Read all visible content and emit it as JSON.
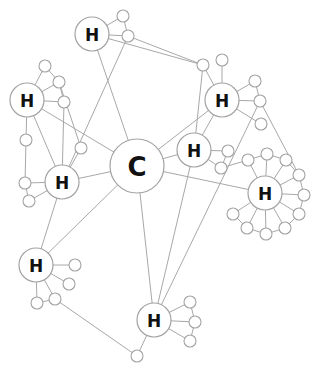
{
  "diagram": {
    "title": "",
    "colors": {
      "edge": "#a8a8a8",
      "node_stroke": "#a3a3a3",
      "node_fill": "#ffffff",
      "label": "#111111"
    },
    "hubs": [
      {
        "id": "C",
        "label": "C",
        "x": 137,
        "y": 166,
        "r": 27,
        "size": 26
      },
      {
        "id": "H1",
        "label": "H",
        "x": 92,
        "y": 34,
        "r": 17,
        "size": 17
      },
      {
        "id": "H2",
        "label": "H",
        "x": 27,
        "y": 100,
        "r": 17,
        "size": 17
      },
      {
        "id": "H3",
        "label": "H",
        "x": 62,
        "y": 182,
        "r": 17,
        "size": 17
      },
      {
        "id": "H4",
        "label": "H",
        "x": 222,
        "y": 100,
        "r": 17,
        "size": 17
      },
      {
        "id": "H5",
        "label": "H",
        "x": 194,
        "y": 150,
        "r": 17,
        "size": 17
      },
      {
        "id": "H6",
        "label": "H",
        "x": 265,
        "y": 193,
        "r": 17,
        "size": 17
      },
      {
        "id": "H7",
        "label": "H",
        "x": 36,
        "y": 265,
        "r": 17,
        "size": 17
      },
      {
        "id": "H8",
        "label": "H",
        "x": 154,
        "y": 320,
        "r": 17,
        "size": 17
      }
    ],
    "leaves": [
      {
        "id": "a1",
        "x": 123,
        "y": 16
      },
      {
        "id": "a2",
        "x": 128,
        "y": 36
      },
      {
        "id": "b1",
        "x": 45,
        "y": 66
      },
      {
        "id": "b2",
        "x": 59,
        "y": 82
      },
      {
        "id": "b3",
        "x": 64,
        "y": 102
      },
      {
        "id": "b4",
        "x": 26,
        "y": 140
      },
      {
        "id": "c1",
        "x": 81,
        "y": 148
      },
      {
        "id": "c2",
        "x": 25,
        "y": 183
      },
      {
        "id": "c3",
        "x": 29,
        "y": 201
      },
      {
        "id": "d1",
        "x": 203,
        "y": 65
      },
      {
        "id": "d2",
        "x": 222,
        "y": 60
      },
      {
        "id": "d3",
        "x": 255,
        "y": 81
      },
      {
        "id": "d4",
        "x": 260,
        "y": 101
      },
      {
        "id": "d5",
        "x": 261,
        "y": 124
      },
      {
        "id": "e1",
        "x": 228,
        "y": 151
      },
      {
        "id": "e2",
        "x": 221,
        "y": 168
      },
      {
        "id": "f1",
        "x": 248,
        "y": 160
      },
      {
        "id": "f2",
        "x": 267,
        "y": 154
      },
      {
        "id": "f3",
        "x": 286,
        "y": 160
      },
      {
        "id": "f4",
        "x": 299,
        "y": 175
      },
      {
        "id": "f5",
        "x": 304,
        "y": 195
      },
      {
        "id": "f6",
        "x": 299,
        "y": 214
      },
      {
        "id": "f7",
        "x": 285,
        "y": 228
      },
      {
        "id": "f8",
        "x": 266,
        "y": 234
      },
      {
        "id": "f9",
        "x": 247,
        "y": 228
      },
      {
        "id": "f10",
        "x": 233,
        "y": 214
      },
      {
        "id": "g1",
        "x": 75,
        "y": 265
      },
      {
        "id": "g2",
        "x": 69,
        "y": 284
      },
      {
        "id": "g3",
        "x": 37,
        "y": 303
      },
      {
        "id": "g4",
        "x": 55,
        "y": 299
      },
      {
        "id": "h1",
        "x": 190,
        "y": 302
      },
      {
        "id": "h2",
        "x": 195,
        "y": 322
      },
      {
        "id": "h3",
        "x": 190,
        "y": 341
      },
      {
        "id": "k1",
        "x": 137,
        "y": 356
      }
    ],
    "edges": [
      [
        "C",
        "H1"
      ],
      [
        "C",
        "H2"
      ],
      [
        "C",
        "H3"
      ],
      [
        "C",
        "H4"
      ],
      [
        "C",
        "H5"
      ],
      [
        "C",
        "H6"
      ],
      [
        "C",
        "H7"
      ],
      [
        "C",
        "H8"
      ],
      [
        "H1",
        "a1"
      ],
      [
        "H1",
        "a2"
      ],
      [
        "a1",
        "a2"
      ],
      [
        "a2",
        "H3"
      ],
      [
        "H1",
        "d1"
      ],
      [
        "a2",
        "d1"
      ],
      [
        "H2",
        "b1"
      ],
      [
        "H2",
        "b2"
      ],
      [
        "H2",
        "b3"
      ],
      [
        "H2",
        "b4"
      ],
      [
        "b1",
        "b2"
      ],
      [
        "b2",
        "b3"
      ],
      [
        "H2",
        "H3"
      ],
      [
        "b3",
        "H3"
      ],
      [
        "b4",
        "c2"
      ],
      [
        "H3",
        "c1"
      ],
      [
        "H3",
        "c2"
      ],
      [
        "H3",
        "c3"
      ],
      [
        "c2",
        "c3"
      ],
      [
        "c1",
        "b2"
      ],
      [
        "H3",
        "H7"
      ],
      [
        "H4",
        "d1"
      ],
      [
        "H4",
        "d2"
      ],
      [
        "H4",
        "d3"
      ],
      [
        "H4",
        "d4"
      ],
      [
        "H4",
        "d5"
      ],
      [
        "d3",
        "d4"
      ],
      [
        "H4",
        "H5"
      ],
      [
        "d4",
        "f4"
      ],
      [
        "d4",
        "H8"
      ],
      [
        "H5",
        "e1"
      ],
      [
        "H5",
        "e2"
      ],
      [
        "e1",
        "e2"
      ],
      [
        "e2",
        "f1"
      ],
      [
        "H5",
        "H8"
      ],
      [
        "d1",
        "H5"
      ],
      [
        "H6",
        "f1"
      ],
      [
        "H6",
        "f2"
      ],
      [
        "H6",
        "f3"
      ],
      [
        "H6",
        "f4"
      ],
      [
        "H6",
        "f5"
      ],
      [
        "H6",
        "f6"
      ],
      [
        "H6",
        "f7"
      ],
      [
        "H6",
        "f8"
      ],
      [
        "H6",
        "f9"
      ],
      [
        "H6",
        "f10"
      ],
      [
        "f1",
        "f2"
      ],
      [
        "f2",
        "f3"
      ],
      [
        "f3",
        "f4"
      ],
      [
        "f4",
        "f5"
      ],
      [
        "f5",
        "f6"
      ],
      [
        "f6",
        "f7"
      ],
      [
        "f7",
        "f8"
      ],
      [
        "f8",
        "f9"
      ],
      [
        "f9",
        "f10"
      ],
      [
        "H7",
        "g1"
      ],
      [
        "H7",
        "g2"
      ],
      [
        "H7",
        "g3"
      ],
      [
        "H7",
        "g4"
      ],
      [
        "g3",
        "g4"
      ],
      [
        "g4",
        "k1"
      ],
      [
        "k1",
        "H8"
      ],
      [
        "H8",
        "h1"
      ],
      [
        "H8",
        "h2"
      ],
      [
        "H8",
        "h3"
      ],
      [
        "h1",
        "h2"
      ],
      [
        "h2",
        "h3"
      ]
    ]
  }
}
